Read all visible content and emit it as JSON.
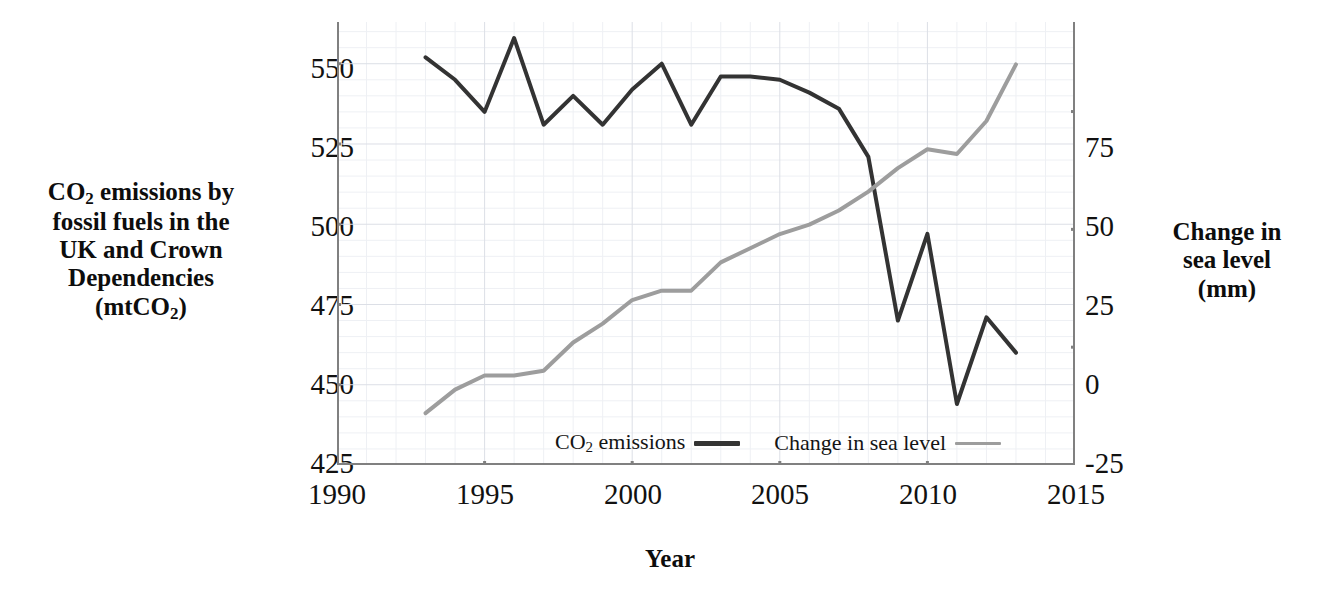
{
  "chart_data": {
    "type": "line",
    "title": "",
    "xlabel": "Year",
    "xlim": [
      1990,
      2015
    ],
    "xticks": [
      1990,
      1995,
      2000,
      2005,
      2010,
      2015
    ],
    "xtick_labels": [
      "1990",
      "1995",
      "2000",
      "2005",
      "2010",
      "2015"
    ],
    "grid": true,
    "grid_minor": true,
    "legend_position": "bottom-center",
    "axes": [
      {
        "id": "left",
        "label_lines": [
          "CO2 emissions by",
          "fossil fuels in the",
          "UK and Crown",
          "Dependencies",
          "(mtCO2)"
        ],
        "label_plain": "CO2 emissions by fossil fuels in the UK and Crown Dependencies (mtCO2)",
        "units": "mtCO2",
        "ylim": [
          425,
          563
        ],
        "yticks": [
          425,
          450,
          475,
          500,
          525,
          550
        ],
        "ytick_labels": [
          "425",
          "450",
          "475",
          "500",
          "525",
          "550"
        ],
        "minor_step": 5
      },
      {
        "id": "right",
        "label_lines": [
          "Change in",
          "sea level",
          "(mm)"
        ],
        "label_plain": "Change in sea level (mm)",
        "units": "mm",
        "ylim": [
          -25,
          69
        ],
        "yticks": [
          -25,
          0,
          25,
          50,
          75
        ],
        "ytick_labels": [
          "-25",
          "0",
          "25",
          "50",
          "75"
        ],
        "minor_step": 5
      }
    ],
    "x": [
      1993,
      1994,
      1995,
      1996,
      1997,
      1998,
      1999,
      2000,
      2001,
      2002,
      2003,
      2004,
      2005,
      2006,
      2007,
      2008,
      2009,
      2010,
      2011,
      2012,
      2013
    ],
    "series": [
      {
        "name": "CO2 emissions",
        "legend_label": "CO2 emissions",
        "axis": "left",
        "color": "#333333",
        "width": 4,
        "values": [
          552,
          545,
          535,
          558,
          531,
          540,
          531,
          542,
          550,
          531,
          546,
          546,
          545,
          541,
          536,
          521,
          470,
          497,
          444,
          471,
          460
        ]
      },
      {
        "name": "Change in sea level",
        "legend_label": "Change in sea level",
        "axis": "right",
        "color": "#9d9d9d",
        "width": 4,
        "values": [
          -14,
          -9,
          -6,
          -6,
          -5,
          1,
          5,
          10,
          12,
          12,
          18,
          21,
          24,
          26,
          29,
          33,
          38,
          42,
          41,
          48,
          60
        ]
      }
    ]
  },
  "legend": {
    "items": [
      {
        "label": "CO2 emissions",
        "color": "#333333"
      },
      {
        "label": "Change in sea level",
        "color": "#9d9d9d"
      }
    ]
  },
  "colors": {
    "co2_line": "#333333",
    "sea_level_line": "#9d9d9d",
    "axis": "#808080",
    "gridline_major": "#dcdfe6",
    "gridline_minor": "#eef0f4",
    "text": "#111111",
    "background": "#ffffff"
  },
  "x_axis_title": "Year",
  "tick_text": {
    "left": [
      "550",
      "525",
      "500",
      "475",
      "450",
      "425"
    ],
    "right": [
      "75",
      "50",
      "25",
      "0",
      "-25"
    ],
    "x": [
      "1990",
      "1995",
      "2000",
      "2005",
      "2010",
      "2015"
    ]
  }
}
